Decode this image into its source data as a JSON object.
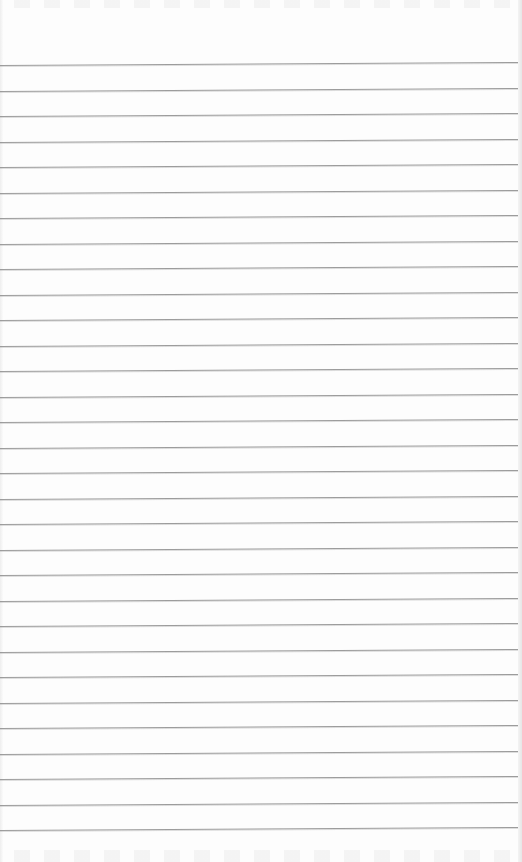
{
  "page": {
    "type": "ruled-notebook-sheet",
    "content_text": "",
    "line_count": 31,
    "first_line_y": 65,
    "line_spacing": 25.5,
    "tilt_px_across_width": -3,
    "colors": {
      "paper": "#fdfdfd",
      "rule": "#9c9c9c",
      "edge_shadow": "#e6e6e6"
    }
  }
}
